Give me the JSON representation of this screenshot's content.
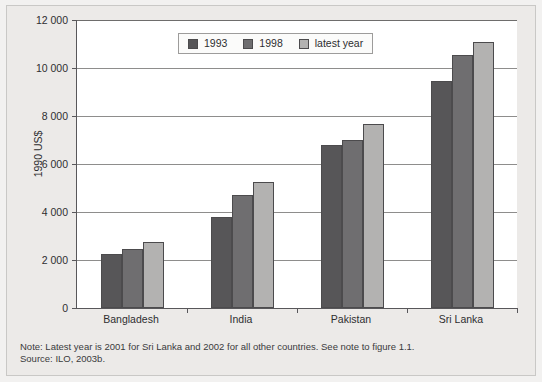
{
  "chart_data": {
    "type": "bar",
    "title": "",
    "xlabel": "",
    "ylabel": "1990 US$",
    "ylim": [
      0,
      12000
    ],
    "yticks": [
      0,
      2000,
      4000,
      6000,
      8000,
      10000,
      12000
    ],
    "ytick_labels": [
      "0",
      "2 000",
      "4 000",
      "6 000",
      "8 000",
      "10 000",
      "12 000"
    ],
    "grid": true,
    "legend_position": "top-center-inside",
    "categories": [
      "Bangladesh",
      "India",
      "Pakistan",
      "Sri Lanka"
    ],
    "series": [
      {
        "name": "1993",
        "color": "#575658",
        "values": [
          2250,
          3800,
          6800,
          9450
        ]
      },
      {
        "name": "1998",
        "color": "#6f6e70",
        "values": [
          2450,
          4700,
          7000,
          10550
        ]
      },
      {
        "name": "latest year",
        "color": "#b3b2b1",
        "values": [
          2750,
          5250,
          7650,
          11100
        ]
      }
    ],
    "annotations": [
      "Note: Latest year is 2001 for Sri Lanka and 2002 for all other countries. See note to figure 1.1.",
      "Source: ILO, 2003b."
    ]
  },
  "footnote": {
    "note": "Note: Latest year is 2001 for Sri Lanka and 2002 for all other countries. See note to figure 1.1.",
    "source": "Source: ILO, 2003b."
  }
}
